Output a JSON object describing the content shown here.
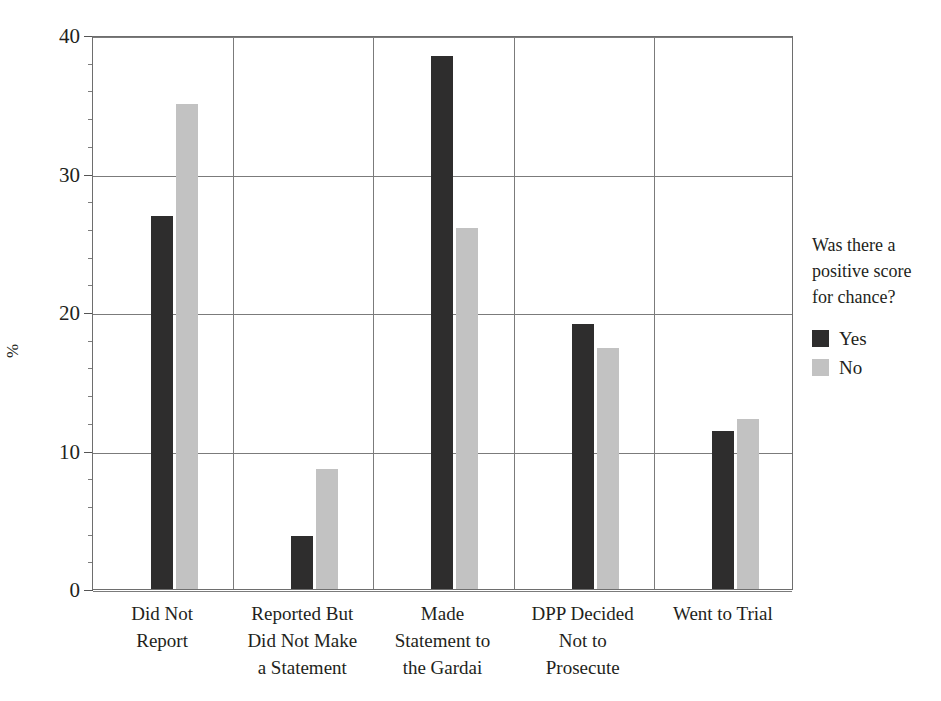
{
  "chart_data": {
    "type": "bar",
    "title": "",
    "subtitle": "",
    "xlabel": "",
    "ylabel": "%",
    "ylim": [
      0,
      40
    ],
    "yticks": [
      0,
      10,
      20,
      30,
      40
    ],
    "ytick_labels": [
      "0",
      "10",
      "20",
      "30",
      "40"
    ],
    "minor_tick_interval": 2,
    "grid": "horizontal-major-and-vertical-category-separators",
    "legend_position": "right",
    "legend_title": "Was there a positive score for chance?",
    "categories": [
      "Did Not Report",
      "Reported But Did Not Make a Statement",
      "Made Statement to the Gardai",
      "DPP Decided Not to Prosecute",
      "Went to Trial"
    ],
    "category_label_lines": [
      [
        "Did Not",
        "Report"
      ],
      [
        "Reported But",
        "Did Not Make",
        "a Statement"
      ],
      [
        "Made",
        "Statement to",
        "the Gardai"
      ],
      [
        "DPP Decided",
        "Not to",
        "Prosecute"
      ],
      [
        "Went to Trial"
      ]
    ],
    "series": [
      {
        "name": "Yes",
        "color": "#2e2d2d",
        "values": [
          26.9,
          3.8,
          38.5,
          19.1,
          11.4
        ]
      },
      {
        "name": "No",
        "color": "#c2c2c2",
        "values": [
          35.0,
          8.7,
          26.1,
          17.4,
          12.3
        ]
      }
    ]
  },
  "axis": {
    "y_title": "%"
  },
  "legend": {
    "title_lines": [
      "Was there a",
      "positive score",
      "for chance?"
    ],
    "items": [
      {
        "label": "Yes",
        "swatch": "dark-swatch"
      },
      {
        "label": "No",
        "swatch": "light-swatch"
      }
    ]
  }
}
